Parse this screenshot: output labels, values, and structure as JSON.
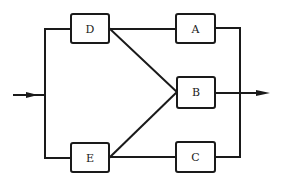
{
  "diagram": {
    "type": "reliability-block-diagram",
    "blocks": [
      {
        "id": "D",
        "label": "D"
      },
      {
        "id": "A",
        "label": "A"
      },
      {
        "id": "B",
        "label": "B"
      },
      {
        "id": "E",
        "label": "E"
      },
      {
        "id": "C",
        "label": "C"
      }
    ],
    "connections": [
      {
        "from": "input",
        "to": "D"
      },
      {
        "from": "input",
        "to": "E"
      },
      {
        "from": "D",
        "to": "A"
      },
      {
        "from": "D",
        "to": "B"
      },
      {
        "from": "E",
        "to": "B"
      },
      {
        "from": "E",
        "to": "C"
      },
      {
        "from": "A",
        "to": "output"
      },
      {
        "from": "B",
        "to": "output"
      },
      {
        "from": "C",
        "to": "output"
      }
    ],
    "input_label": "",
    "output_label": "",
    "colors": {
      "line": "#1a1a1a",
      "background": "#ffffff"
    }
  }
}
